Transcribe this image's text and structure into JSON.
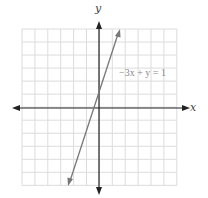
{
  "chart_data": {
    "type": "line",
    "title": "",
    "xlabel": "x",
    "ylabel": "y",
    "xlim": [
      -6,
      6
    ],
    "ylim": [
      -6,
      6
    ],
    "grid": true,
    "series": [
      {
        "name": "-3x + y = 1",
        "equation": "y = 3x + 1",
        "x": [
          -1.8,
          1.5
        ],
        "y": [
          -4.4,
          5.5
        ]
      }
    ],
    "annotations": [
      {
        "text": "−3x + y = 1",
        "x": 2,
        "y": 3
      }
    ],
    "colors": {
      "line": "#777777",
      "axis": "#222222",
      "grid": "#dddddd"
    }
  },
  "labels": {
    "x_axis": "x",
    "y_axis": "y",
    "equation": "−3x + y = 1"
  }
}
